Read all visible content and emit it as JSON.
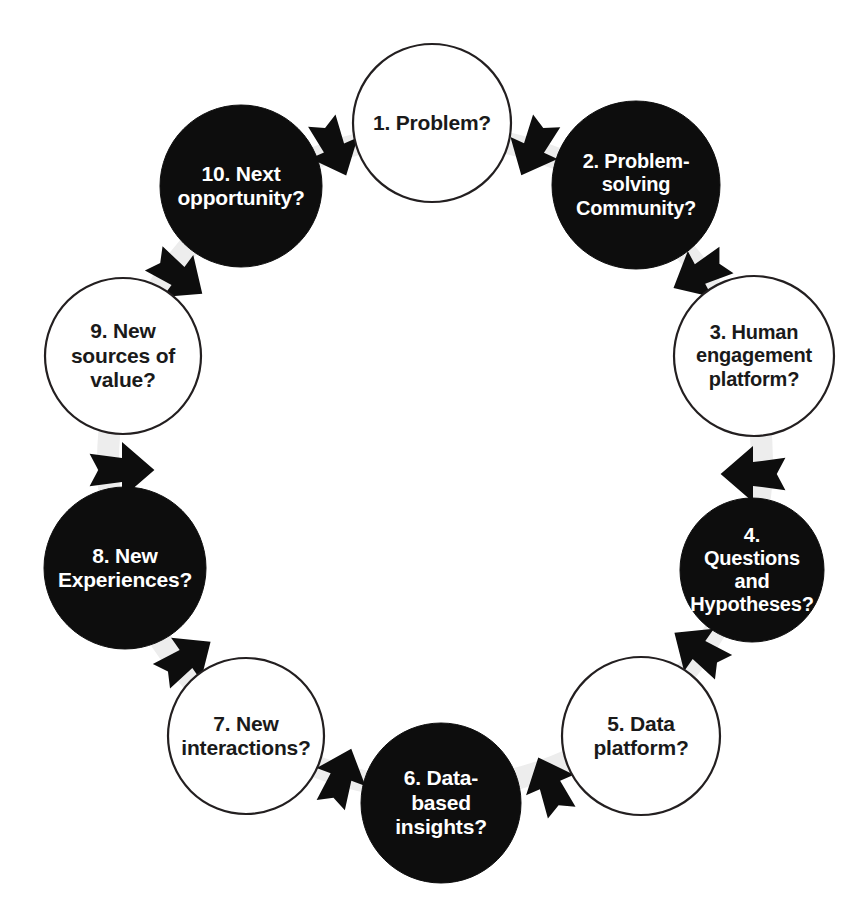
{
  "diagram": {
    "type": "cycle",
    "orientation": "clockwise",
    "background_color": "#ffffff",
    "dark_fill": "#0d0d0d",
    "light_fill": "#ffffff",
    "stroke_color": "#231f20",
    "dark_text_color": "#ffffff",
    "light_text_color": "#1a1a1a",
    "guide_ring_color": "#ededed",
    "node_count": 10,
    "arrow_count": 10,
    "nodes": [
      {
        "id": 1,
        "label": "1. Problem?",
        "style": "light",
        "cx": 432,
        "cy": 123,
        "r": 79,
        "font_size": 21,
        "angle_deg": -90
      },
      {
        "id": 2,
        "label": "2. Problem-\nsolving\nCommunity?",
        "style": "dark",
        "cx": 636,
        "cy": 185,
        "r": 84,
        "font_size": 20,
        "angle_deg": -54
      },
      {
        "id": 3,
        "label": "3. Human\nengagement\nplatform?",
        "style": "light",
        "cx": 754,
        "cy": 356,
        "r": 80,
        "font_size": 20,
        "angle_deg": -18
      },
      {
        "id": 4,
        "label": "4.\nQuestions\nand\nHypotheses?",
        "style": "dark",
        "cx": 752,
        "cy": 570,
        "r": 72,
        "font_size": 20,
        "angle_deg": 18
      },
      {
        "id": 5,
        "label": "5. Data\nplatform?",
        "style": "light",
        "cx": 641,
        "cy": 736,
        "r": 79,
        "font_size": 21,
        "angle_deg": 54
      },
      {
        "id": 6,
        "label": "6. Data-\nbased\ninsights?",
        "style": "dark",
        "cx": 441,
        "cy": 803,
        "r": 80,
        "font_size": 21,
        "angle_deg": 90
      },
      {
        "id": 7,
        "label": "7. New\ninteractions?",
        "style": "light",
        "cx": 246,
        "cy": 736,
        "r": 78,
        "font_size": 21,
        "angle_deg": 126
      },
      {
        "id": 8,
        "label": "8. New\nExperiences?",
        "style": "dark",
        "cx": 125,
        "cy": 568,
        "r": 81,
        "font_size": 21,
        "angle_deg": 162
      },
      {
        "id": 9,
        "label": "9. New\nsources of\nvalue?",
        "style": "light",
        "cx": 123,
        "cy": 356,
        "r": 78,
        "font_size": 21,
        "angle_deg": -162
      },
      {
        "id": 10,
        "label": "10. Next\nopportunity?",
        "style": "dark",
        "cx": 241,
        "cy": 186,
        "r": 81,
        "font_size": 21,
        "angle_deg": -126
      }
    ],
    "arrows": [
      {
        "id": "a1",
        "from": 1,
        "to": 2,
        "x": 534,
        "y": 148,
        "rotation": 115,
        "scale": 1.0
      },
      {
        "id": "a2",
        "from": 2,
        "to": 3,
        "x": 700,
        "y": 274,
        "rotation": 152,
        "scale": 1.0
      },
      {
        "id": "a3",
        "from": 3,
        "to": 4,
        "x": 753,
        "y": 474,
        "rotation": 180,
        "scale": 1.08
      },
      {
        "id": "a4",
        "from": 4,
        "to": 5,
        "x": 699,
        "y": 650,
        "rotation": 215,
        "scale": 1.0
      },
      {
        "id": "a5",
        "from": 5,
        "to": 6,
        "x": 550,
        "y": 785,
        "rotation": 247,
        "scale": 1.0
      },
      {
        "id": "a6",
        "from": 6,
        "to": 7,
        "x": 341,
        "y": 777,
        "rotation": 290,
        "scale": 1.0
      },
      {
        "id": "a7",
        "from": 7,
        "to": 8,
        "x": 186,
        "y": 659,
        "rotation": 325,
        "scale": 1.0
      },
      {
        "id": "a8",
        "from": 8,
        "to": 9,
        "x": 122,
        "y": 470,
        "rotation": 0,
        "scale": 1.08
      },
      {
        "id": "a9",
        "from": 9,
        "to": 10,
        "x": 178,
        "y": 276,
        "rotation": 36,
        "scale": 1.0
      },
      {
        "id": "a10",
        "from": 10,
        "to": 1,
        "x": 334,
        "y": 148,
        "rotation": 66,
        "scale": 1.0
      }
    ],
    "guide_ring": {
      "cx": 435,
      "cy": 462,
      "r": 327,
      "stroke_width": 22
    }
  }
}
